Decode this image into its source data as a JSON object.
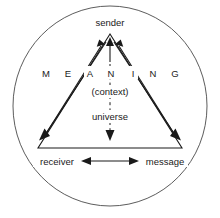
{
  "diagram": {
    "nodes": {
      "top": "sender",
      "bottom_left": "receiver",
      "bottom_right": "message"
    },
    "center": {
      "context": "(context)",
      "universe": "universe"
    },
    "meaning": {
      "full": "MEANING",
      "letters": [
        "M",
        "E",
        "A",
        "N",
        "I",
        "N",
        "G"
      ]
    },
    "colors": {
      "ink": "#1a1a1a",
      "circle": "#4a4a4a",
      "background": "#ffffff"
    }
  }
}
